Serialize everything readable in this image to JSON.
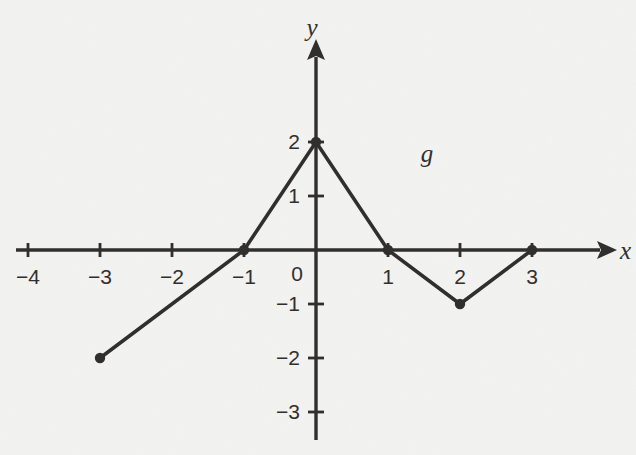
{
  "figure": {
    "background_color": "#f3f3f1",
    "ink_color": "#312f2d"
  },
  "chart_data": {
    "type": "line",
    "title": "",
    "curve_name": "g",
    "x_axis_label": "x",
    "y_axis_label": "y",
    "origin_label": "0",
    "grid": false,
    "legend_position": "none",
    "xlim": [
      -4.6,
      4.4
    ],
    "ylim": [
      -3.7,
      3.9
    ],
    "x_ticks": [
      {
        "value": -4,
        "label": "−4"
      },
      {
        "value": -3,
        "label": "−3"
      },
      {
        "value": -2,
        "label": "−2"
      },
      {
        "value": -1,
        "label": "−1"
      },
      {
        "value": 1,
        "label": "1"
      },
      {
        "value": 2,
        "label": "2"
      },
      {
        "value": 3,
        "label": "3"
      }
    ],
    "y_ticks": [
      {
        "value": 2,
        "label": "2"
      },
      {
        "value": 1,
        "label": "1"
      },
      {
        "value": -1,
        "label": "−1"
      },
      {
        "value": -2,
        "label": "−2"
      },
      {
        "value": -3,
        "label": "−3"
      }
    ],
    "points": [
      [
        -3,
        -2
      ],
      [
        -1,
        0
      ],
      [
        0,
        2
      ],
      [
        1,
        0
      ],
      [
        2,
        -1
      ],
      [
        3,
        0
      ]
    ],
    "marked_points": [
      [
        -3,
        -2
      ],
      [
        -1,
        0
      ],
      [
        0,
        2
      ],
      [
        1,
        0
      ],
      [
        2,
        -1
      ],
      [
        3,
        0
      ]
    ],
    "curve_label_position": [
      1.54,
      1.78
    ]
  }
}
